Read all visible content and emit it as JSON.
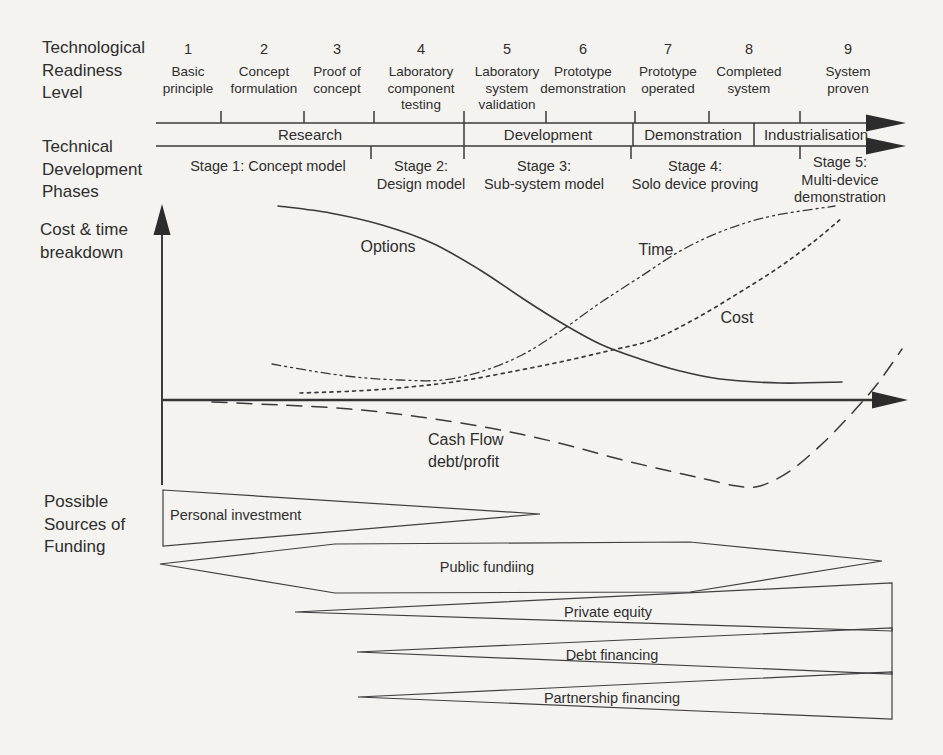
{
  "headers": {
    "trl": "Technological Readiness Level",
    "phases": "Technical Development Phases",
    "cost": "Cost & time breakdown",
    "funding": "Possible Sources of Funding"
  },
  "trl_levels": [
    {
      "num": "1",
      "label": "Basic principle"
    },
    {
      "num": "2",
      "label": "Concept formulation"
    },
    {
      "num": "3",
      "label": "Proof of concept"
    },
    {
      "num": "4",
      "label": "Laboratory component testing"
    },
    {
      "num": "5",
      "label": "Laboratory system validation"
    },
    {
      "num": "6",
      "label": "Prototype demonstration"
    },
    {
      "num": "7",
      "label": "Prototype operated"
    },
    {
      "num": "8",
      "label": "Completed system"
    },
    {
      "num": "9",
      "label": "System proven"
    }
  ],
  "phases": [
    {
      "label": "Research"
    },
    {
      "label": "Development"
    },
    {
      "label": "Demonstration"
    },
    {
      "label": "Industrialisation"
    }
  ],
  "stages": [
    {
      "title": "Stage 1: Concept model",
      "subtitle": ""
    },
    {
      "title": "Stage 2:",
      "subtitle": "Design model"
    },
    {
      "title": "Stage 3:",
      "subtitle": "Sub-system model"
    },
    {
      "title": "Stage 4:",
      "subtitle": "Solo device proving"
    },
    {
      "title": "Stage 5:",
      "subtitle": "Multi-device demonstration"
    }
  ],
  "funding": [
    {
      "label": "Personal investment"
    },
    {
      "label": "Public fundiing"
    },
    {
      "label": "Private equity"
    },
    {
      "label": "Debt financing"
    },
    {
      "label": "Partnership financing"
    }
  ],
  "chart_data": {
    "type": "line",
    "title": "Cost & time breakdown",
    "xlabel": "Technology readiness level 1-9 / development stage (unlabeled arrow axis)",
    "ylabel": "Relative magnitude (unlabeled arrow axis; below baseline = debt)",
    "grid": false,
    "legend": "inline labels next to curves",
    "baseline_y_px": 400,
    "series": [
      {
        "name": "Options",
        "line_style": "solid",
        "trend": "starts at maximum during research, S-curve decline toward the baseline as the design converges",
        "points_px": [
          [
            278,
            206
          ],
          [
            330,
            213
          ],
          [
            382,
            225
          ],
          [
            432,
            243
          ],
          [
            480,
            270
          ],
          [
            522,
            298
          ],
          [
            560,
            322
          ],
          [
            600,
            344
          ],
          [
            640,
            359
          ],
          [
            680,
            371
          ],
          [
            720,
            379
          ],
          [
            780,
            383
          ],
          [
            842,
            382
          ]
        ]
      },
      {
        "name": "Time",
        "line_style": "dash-dot",
        "trend": "shallow dip in early research then steep sustained rise to a maximum at TRL 9",
        "points_px": [
          [
            272,
            364
          ],
          [
            312,
            371
          ],
          [
            355,
            377
          ],
          [
            400,
            380
          ],
          [
            443,
            380
          ],
          [
            483,
            371
          ],
          [
            522,
            355
          ],
          [
            562,
            330
          ],
          [
            600,
            303
          ],
          [
            640,
            277
          ],
          [
            682,
            250
          ],
          [
            725,
            230
          ],
          [
            772,
            216
          ],
          [
            835,
            206
          ]
        ]
      },
      {
        "name": "Cost",
        "line_style": "dotted",
        "trend": "near the baseline through research, accelerating rise through demonstration and industrialisation",
        "points_px": [
          [
            300,
            393
          ],
          [
            355,
            391
          ],
          [
            410,
            387
          ],
          [
            460,
            381
          ],
          [
            510,
            372
          ],
          [
            560,
            362
          ],
          [
            608,
            351
          ],
          [
            652,
            340
          ],
          [
            695,
            319
          ],
          [
            737,
            294
          ],
          [
            778,
            268
          ],
          [
            812,
            243
          ],
          [
            842,
            218
          ]
        ]
      },
      {
        "name": "Cash Flow debt/profit",
        "line_style": "long-dash",
        "trend": "negative (debt) deepening to a minimum around stage 4-5, then sharp recovery crossing the baseline into profit at TRL 9",
        "points_px": [
          [
            212,
            402
          ],
          [
            280,
            405
          ],
          [
            350,
            409
          ],
          [
            420,
            417
          ],
          [
            490,
            428
          ],
          [
            555,
            442
          ],
          [
            615,
            458
          ],
          [
            665,
            470
          ],
          [
            705,
            479
          ],
          [
            737,
            486
          ],
          [
            760,
            486
          ],
          [
            790,
            471
          ],
          [
            822,
            444
          ],
          [
            854,
            411
          ],
          [
            878,
            383
          ],
          [
            902,
            349
          ]
        ]
      }
    ]
  }
}
